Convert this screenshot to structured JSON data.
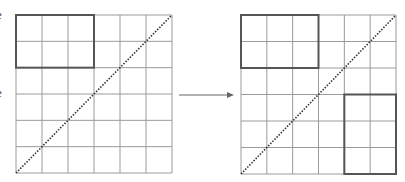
{
  "figure": {
    "edge_labels": [
      {
        "text": "e",
        "x": -4,
        "y": 8
      },
      {
        "text": "e",
        "x": -4,
        "y": 86
      }
    ],
    "colors": {
      "grid_line": "#9a9a9a",
      "highlight": "#555555",
      "diagonal": "#333333",
      "arrow": "#666666"
    },
    "grid_size": 6,
    "panels": [
      {
        "name": "left-grid",
        "x": 16,
        "y": 15,
        "width": 156,
        "height": 158,
        "diagonal": "bottom-left-to-top-right",
        "highlights": [
          {
            "col": 0,
            "row": 0,
            "cols": 3,
            "rows": 2
          }
        ]
      },
      {
        "name": "right-grid",
        "x": 241,
        "y": 15,
        "width": 155,
        "height": 159,
        "diagonal": "bottom-left-to-top-right",
        "highlights": [
          {
            "col": 0,
            "row": 0,
            "cols": 3,
            "rows": 2
          },
          {
            "col": 4,
            "row": 3,
            "cols": 2,
            "rows": 3
          }
        ]
      }
    ],
    "arrow": {
      "x1": 179,
      "y1": 95,
      "x2": 234,
      "y2": 95
    }
  }
}
